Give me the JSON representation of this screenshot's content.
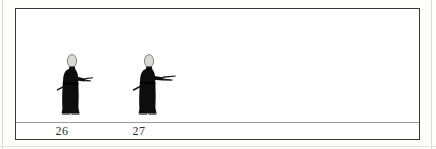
{
  "plate": {
    "background_color": "#ffffff",
    "border_color": "#3a3a3a",
    "page_color": "#fdfdfc",
    "ground_line_color": "#9a9a9a"
  },
  "figures": [
    {
      "number": "26",
      "description": "standing robed figure, black robe, pale oval head, sword at hip angled down-left, right arm extended forward holding object",
      "robe_color": "#0d0d0d",
      "head_color": "#d8d8d4",
      "label": "26"
    },
    {
      "number": "27",
      "description": "standing robed figure, black robe, pale oval head, sword at hip angled down-left, right arm extended forward holding long object",
      "robe_color": "#0d0d0d",
      "head_color": "#d8d8d4",
      "label": "27"
    }
  ],
  "labels": {
    "first": "26",
    "second": "27"
  }
}
